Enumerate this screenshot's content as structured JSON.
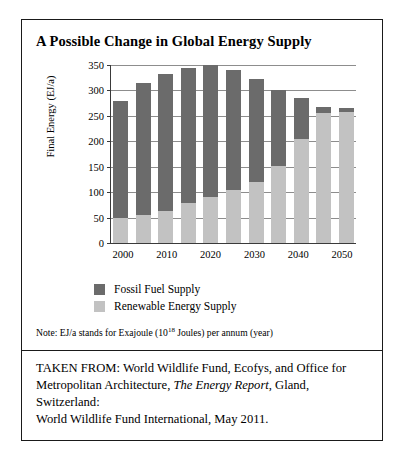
{
  "figure": {
    "title": "A Possible Change in Global Energy Supply",
    "note_prefix": "Note: EJ/a stands for Exajoule (10",
    "note_exponent": "18",
    "note_suffix": " Joules) per annum (year)",
    "source_line1": "TAKEN FROM: World Wildlife Fund, Ecofys, and Office for",
    "source_line2_a": "Metropolitan Architecture, ",
    "source_line2_italic": "The Energy Report",
    "source_line2_b": ", Gland, Switzerland:",
    "source_line3": "World Wildlife Fund International, May 2011."
  },
  "legend": {
    "items": [
      {
        "label": "Fossil Fuel Supply",
        "color": "#6b6b6b"
      },
      {
        "label": "Renewable Energy Supply",
        "color": "#c2c2c2"
      }
    ]
  },
  "chart_data": {
    "type": "bar",
    "title": "A Possible Change in Global Energy Supply",
    "xlabel": "",
    "ylabel": "Final Energy (EJ/a)",
    "ylim": [
      0,
      350
    ],
    "yticks": [
      0,
      50,
      100,
      150,
      200,
      250,
      300,
      350
    ],
    "grid": true,
    "stacked": true,
    "legend_position": "below-plot",
    "categories": [
      "2000",
      "2005",
      "2010",
      "2015",
      "2020",
      "2025",
      "2030",
      "2035",
      "2040",
      "2045",
      "2050"
    ],
    "tick_labels_shown": [
      "2000",
      "2010",
      "2020",
      "2030",
      "2040",
      "2050"
    ],
    "series": [
      {
        "name": "Renewable Energy Supply",
        "color": "#c2c2c2",
        "values": [
          50,
          56,
          63,
          78,
          91,
          104,
          120,
          152,
          205,
          255,
          258
        ]
      },
      {
        "name": "Fossil Fuel Supply",
        "color": "#6b6b6b",
        "values": [
          230,
          259,
          269,
          267,
          259,
          236,
          202,
          148,
          80,
          13,
          7
        ]
      }
    ],
    "totals": [
      280,
      315,
      332,
      345,
      350,
      340,
      322,
      300,
      285,
      268,
      265
    ]
  }
}
